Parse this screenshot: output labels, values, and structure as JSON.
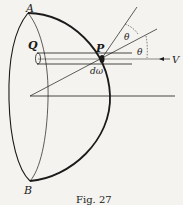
{
  "figure": {
    "caption": "Fig. 27",
    "labels": {
      "A": "A",
      "B": "B",
      "Q": "Q",
      "P": "P",
      "theta_upper": "θ",
      "theta_lower": "θ",
      "V": "V",
      "d_omega": "dω"
    },
    "colors": {
      "ink": "#1a1a1a",
      "paper": "#f4f3ef"
    }
  }
}
